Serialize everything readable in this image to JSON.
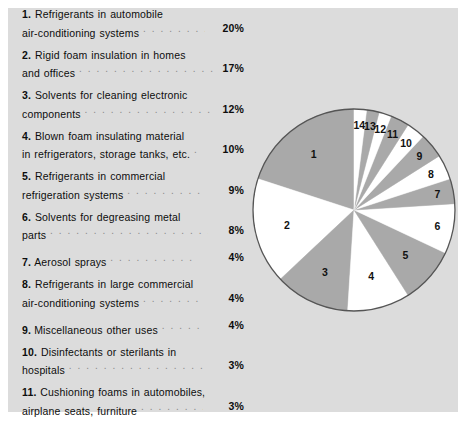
{
  "figure": {
    "panel_color": "#dcdcdc",
    "page_color": "#ffffff"
  },
  "legend": {
    "dots": ". . . . . . . . . . . . . . . . . . . . . . . . . . . . . . . . . . . . . . . .",
    "items": [
      {
        "num": "1.",
        "line1": "Refrigerants in automobile",
        "line2": "air-conditioning systems",
        "pct": "20%",
        "dot_width": 62
      },
      {
        "num": "2.",
        "line1": "Rigid foam insulation in homes",
        "line2": "and offices",
        "pct": "17%",
        "dot_width": 134
      },
      {
        "num": "3.",
        "line1": "Solvents for cleaning electronic",
        "line2": "components",
        "pct": "12%",
        "dot_width": 125
      },
      {
        "num": "4.",
        "line1": "Blown foam insulating material",
        "line2": "in refrigerators, storage tanks, etc.",
        "pct": "10%",
        "dot_width": 4
      },
      {
        "num": "5.",
        "line1": "Refrigerants in commercial",
        "line2": "refrigeration systems",
        "pct": "9%",
        "dot_width": 77
      },
      {
        "num": "6.",
        "line1": "Solvents for degreasing metal",
        "line2": "parts",
        "pct": "8%",
        "dot_width": 158
      },
      {
        "num": "7.",
        "line1": "",
        "line2": "Aerosol sprays",
        "pct": "4%",
        "dot_width": 84
      },
      {
        "num": "8.",
        "line1": "Refrigerants in large commercial",
        "line2": "air-conditioning systems",
        "pct": "4%",
        "dot_width": 60
      },
      {
        "num": "9.",
        "line1": "",
        "line2": "Miscellaneous other uses",
        "pct": "4%",
        "dot_width": 42
      },
      {
        "num": "10.",
        "line1": "Disinfectants or sterilants in",
        "line2": "hospitals",
        "pct": "3%",
        "dot_width": 138
      },
      {
        "num": "11.",
        "line1": "Cushioning foams in automobiles,",
        "line2": "airplane seats, furniture",
        "pct": "3%",
        "dot_width": 62
      },
      {
        "num": "12.",
        "line1": "Refrigerants in home",
        "line2": "refrigerators",
        "pct": "2%",
        "dot_width": 120
      },
      {
        "num": "13.",
        "line1": "Polystyrene foam plastics, such",
        "line2": "as fast-food containers",
        "pct": "2%",
        "dot_width": 68
      },
      {
        "num": "14.",
        "line1": "Food freezants (a new technology",
        "line1b": "used to process frozen foods by",
        "line2": "immersing them in CFCs)",
        "pct": "2%",
        "dot_width": 56
      }
    ]
  },
  "chart_data": {
    "type": "pie",
    "title": "",
    "start_angle_deg": 90,
    "direction": "counterclockwise",
    "center": [
      104,
      104
    ],
    "radius": 101,
    "stroke_color": "#555555",
    "colors": {
      "gray": "#a9a9a9",
      "white": "#ffffff"
    },
    "legend_position": "left-list",
    "labels": [
      "1",
      "2",
      "3",
      "4",
      "5",
      "6",
      "7",
      "8",
      "9",
      "10",
      "11",
      "12",
      "13",
      "14"
    ],
    "values": [
      20,
      17,
      12,
      10,
      9,
      8,
      4,
      4,
      4,
      3,
      3,
      2,
      2,
      2
    ],
    "value_unit": "percent",
    "slice_fills": [
      "gray",
      "white",
      "gray",
      "white",
      "gray",
      "white",
      "gray",
      "white",
      "gray",
      "white",
      "gray",
      "white",
      "gray",
      "white"
    ],
    "slices": [
      {
        "label": "1",
        "value": 20,
        "fill": "gray",
        "name": "Refrigerants in automobile air-conditioning systems"
      },
      {
        "label": "2",
        "value": 17,
        "fill": "white",
        "name": "Rigid foam insulation in homes and offices"
      },
      {
        "label": "3",
        "value": 12,
        "fill": "gray",
        "name": "Solvents for cleaning electronic components"
      },
      {
        "label": "4",
        "value": 10,
        "fill": "white",
        "name": "Blown foam insulating material in refrigerators, storage tanks, etc."
      },
      {
        "label": "5",
        "value": 9,
        "fill": "gray",
        "name": "Refrigerants in commercial refrigeration systems"
      },
      {
        "label": "6",
        "value": 8,
        "fill": "white",
        "name": "Solvents for degreasing metal parts"
      },
      {
        "label": "7",
        "value": 4,
        "fill": "gray",
        "name": "Aerosol sprays"
      },
      {
        "label": "8",
        "value": 4,
        "fill": "white",
        "name": "Refrigerants in large commercial air-conditioning systems"
      },
      {
        "label": "9",
        "value": 4,
        "fill": "gray",
        "name": "Miscellaneous other uses"
      },
      {
        "label": "10",
        "value": 3,
        "fill": "white",
        "name": "Disinfectants or sterilants in hospitals"
      },
      {
        "label": "11",
        "value": 3,
        "fill": "gray",
        "name": "Cushioning foams in automobiles, airplane seats, furniture"
      },
      {
        "label": "12",
        "value": 2,
        "fill": "white",
        "name": "Refrigerants in home refrigerators"
      },
      {
        "label": "13",
        "value": 2,
        "fill": "gray",
        "name": "Polystyrene foam plastics, such as fast-food containers"
      },
      {
        "label": "14",
        "value": 2,
        "fill": "white",
        "name": "Food freezants (a new technology used to process frozen foods by immersing them in CFCs)"
      }
    ]
  }
}
